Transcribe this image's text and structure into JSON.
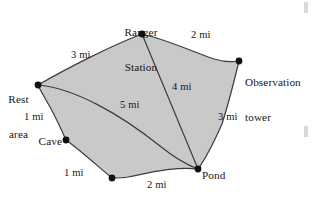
{
  "diagram": {
    "type": "weighted-graph-map",
    "fill_color": "#c9c9c9",
    "stroke_color": "#3c3c3c",
    "node_color": "#101010",
    "unit": "mi",
    "nodes": [
      {
        "id": "ranger-station",
        "label": "Ranger\nStation",
        "x": 142,
        "y": 34
      },
      {
        "id": "observation-tower",
        "label": "Observation\ntower",
        "x": 239,
        "y": 61
      },
      {
        "id": "rest-area",
        "label": "Rest\narea",
        "x": 38,
        "y": 85
      },
      {
        "id": "cave",
        "label": "Cave",
        "x": 66,
        "y": 140
      },
      {
        "id": "beaver-dam",
        "label": "Beaver\ndam",
        "x": 112,
        "y": 178
      },
      {
        "id": "pond",
        "label": "Pond",
        "x": 198,
        "y": 169
      }
    ],
    "edges": [
      {
        "id": "rest-ranger",
        "from": "rest-area",
        "to": "ranger-station",
        "label": "3 mi",
        "value": 3
      },
      {
        "id": "ranger-obs",
        "from": "ranger-station",
        "to": "observation-tower",
        "label": "2 mi",
        "value": 2
      },
      {
        "id": "obs-pond",
        "from": "observation-tower",
        "to": "pond",
        "label": "3 mi",
        "value": 3
      },
      {
        "id": "rest-cave",
        "from": "rest-area",
        "to": "cave",
        "label": "1 mi",
        "value": 1
      },
      {
        "id": "cave-beaver",
        "from": "cave",
        "to": "beaver-dam",
        "label": "1 mi",
        "value": 1
      },
      {
        "id": "beaver-pond",
        "from": "beaver-dam",
        "to": "pond",
        "label": "2 mi",
        "value": 2
      },
      {
        "id": "ranger-pond",
        "from": "ranger-station",
        "to": "pond",
        "label": "4 mi",
        "value": 4
      },
      {
        "id": "rest-pond",
        "from": "rest-area",
        "to": "pond",
        "label": "5 mi",
        "value": 5
      }
    ]
  },
  "labels": {
    "ranger_station_line1": "Ranger",
    "ranger_station_line2": "Station",
    "observation_tower_line1": "Observation",
    "observation_tower_line2": "tower",
    "rest_area_line1": "Rest",
    "rest_area_line2": "area",
    "cave": "Cave",
    "beaver_dam_line1": "Beaver",
    "beaver_dam_line2": "dam",
    "pond": "Pond"
  },
  "edge_labels": {
    "rest_ranger": "3 mi",
    "ranger_obs": "2 mi",
    "obs_pond": "3 mi",
    "rest_cave": "1 mi",
    "cave_beaver": "1 mi",
    "beaver_pond": "2 mi",
    "ranger_pond": "4 mi",
    "rest_pond": "5 mi"
  }
}
